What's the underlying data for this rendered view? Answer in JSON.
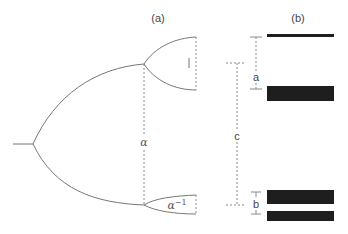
{
  "panels": {
    "a": {
      "label": "(a)"
    },
    "b": {
      "label": "(b)"
    }
  },
  "panel_a": {
    "dashed_label": "α",
    "upper_fork_mark": "|",
    "lower_fork_label": "α",
    "lower_fork_label_sup": "−1"
  },
  "panel_b": {
    "dimension_labels": {
      "a": "a",
      "b": "b",
      "c": "c"
    },
    "bars": [
      {
        "y": 34,
        "height": 3
      },
      {
        "y": 86,
        "height": 15
      },
      {
        "y": 190,
        "height": 14
      },
      {
        "y": 211,
        "height": 10
      }
    ]
  },
  "colors": {
    "line": "#777777",
    "bar": "#1e1e1e",
    "dash": "#888888"
  }
}
